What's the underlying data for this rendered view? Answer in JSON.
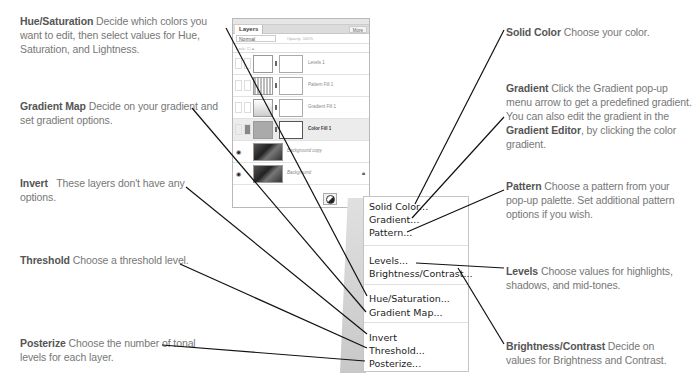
{
  "layers_panel": {
    "tab_label": "Layers",
    "more_button": "More",
    "blend_mode": "Normal",
    "opacity_label": "Opacity: 100%",
    "lock_label": "Lock:",
    "layers": [
      {
        "name": "Levels 1",
        "type": "levels",
        "selected": false,
        "visible": false
      },
      {
        "name": "Pattern Fill 1",
        "type": "pattern",
        "selected": false,
        "visible": false
      },
      {
        "name": "Gradient Fill 1",
        "type": "gradient",
        "selected": false,
        "visible": false
      },
      {
        "name": "Color Fill 1",
        "type": "color",
        "selected": true,
        "visible": false
      },
      {
        "name": "Background copy",
        "type": "photo",
        "selected": false,
        "visible": true
      },
      {
        "name": "Background",
        "type": "photo",
        "selected": false,
        "visible": true
      }
    ]
  },
  "menu": {
    "groups": [
      [
        "Solid Color...",
        "Gradient...",
        "Pattern..."
      ],
      [
        "Levels...",
        "Brightness/Contrast..."
      ],
      [
        "Hue/Saturation...",
        "Gradient Map..."
      ],
      [
        "Invert",
        "Threshold...",
        "Posterize..."
      ]
    ]
  },
  "callouts": {
    "hue_saturation": {
      "title": "Hue/Saturation",
      "text": " Decide which colors you want to edit, then select values for Hue, Saturation, and Lightness."
    },
    "gradient_map": {
      "title": "Gradient Map",
      "text": " Decide on your gradient and set gradient options."
    },
    "invert": {
      "title": "Invert",
      "text": "   These layers don't have any options."
    },
    "threshold": {
      "title": "Threshold",
      "text": " Choose a threshold level."
    },
    "posterize": {
      "title": "Posterize",
      "text": " Choose the number of tonal levels for each layer."
    },
    "solid_color": {
      "title": "Solid Color",
      "text": " Choose your color."
    },
    "gradient": {
      "title": "Gradient",
      "text": " Click the Gradient pop-up menu arrow to get a predefined gradient. You can also edit the gradient in the ",
      "bold2": "Gradient Editor",
      "text2": ", by clicking the color gradient."
    },
    "pattern": {
      "title": "Pattern",
      "text": " Choose a pattern from your pop-up palette. Set additional pattern options if you wish."
    },
    "levels": {
      "title": "Levels",
      "text": " Choose values for highlights, shadows, and mid-tones."
    },
    "brightness_contrast": {
      "title": "Brightness/Contrast",
      "text": " Decide on values for Brightness and Contrast."
    }
  }
}
